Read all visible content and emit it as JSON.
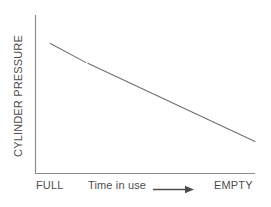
{
  "figure": {
    "kind": "line-chart",
    "background": "#ffffff",
    "line_color": "#6e6e6e",
    "axis_color": "#8c8c8c",
    "text_color": "#4d4d4d"
  },
  "axes": {
    "y_label": "CYLINDER PRESSURE",
    "x_label": "Time in use",
    "x_left_tick": "FULL",
    "x_right_tick": "EMPTY",
    "arrow_icon": "right-arrow-icon"
  },
  "chart_data": {
    "type": "line",
    "title": "",
    "subtitle": "",
    "xlabel": "Time in use",
    "ylabel": "CYLINDER PRESSURE",
    "x": [
      "FULL",
      "EMPTY"
    ],
    "xtick_labels": [
      "FULL",
      "EMPTY"
    ],
    "ytick_labels": [],
    "series": [
      {
        "name": "cylinder pressure during use",
        "x": [
          0.07,
          0.23,
          0.24,
          1.0
        ],
        "values": [
          0.82,
          0.7,
          0.695,
          0.2
        ]
      }
    ],
    "xlim": [
      0,
      1
    ],
    "ylim": [
      0,
      1
    ],
    "grid": false,
    "legend": false,
    "legend_position": "none",
    "annotations": [
      "line declines steadily from upper-left to lower-right",
      "small break in the line near the upper-left third"
    ]
  }
}
